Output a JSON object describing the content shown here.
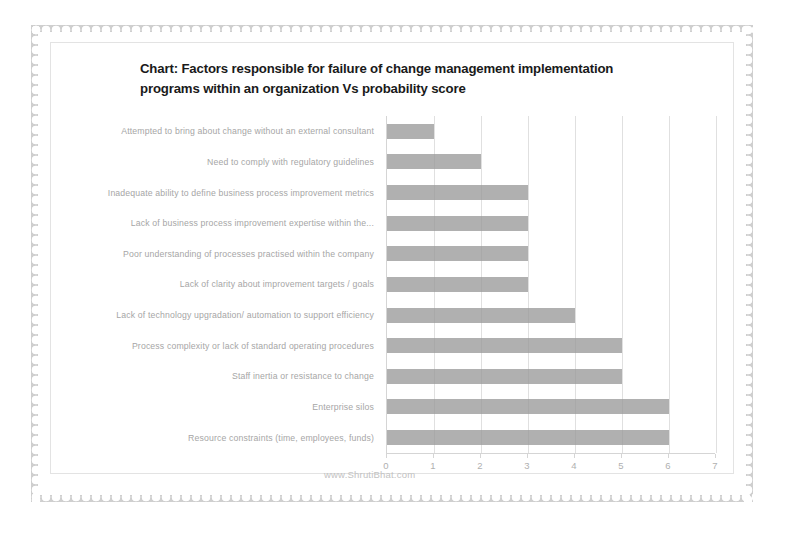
{
  "chart_data": {
    "type": "bar",
    "orientation": "horizontal",
    "title": "Chart: Factors responsible for failure of change management implementation programs within an organization Vs probability score",
    "title_line_1": "Chart: Factors responsible for failure of change management implementation",
    "title_line_2": "programs within an organization Vs probability score",
    "xlabel": "",
    "ylabel": "",
    "xlim": [
      0,
      7
    ],
    "grid": true,
    "legend": "none",
    "xticks": [
      "0",
      "1",
      "2",
      "3",
      "4",
      "5",
      "6",
      "7"
    ],
    "categories": [
      "Attempted to bring about change without an external consultant",
      "Need to comply with regulatory guidelines",
      "Inadequate ability to define business process improvement  metrics",
      "Lack of business process improvement expertise within the...",
      "Poor understanding of processes practised within the company",
      "Lack of clarity about improvement targets / goals",
      "Lack of technology upgradation/ automation to support efficiency",
      "Process complexity or lack of standard operating procedures",
      "Staff inertia or resistance to change",
      "Enterprise silos",
      "Resource constraints (time, employees, funds)"
    ],
    "values": [
      1,
      2,
      3,
      3,
      3,
      3,
      4,
      5,
      5,
      6,
      6
    ],
    "bar_color": "#9a9a9a",
    "grid_color": "#e0e0e0",
    "axis_color": "#d5d5d5",
    "label_color": "#a6a6a6"
  },
  "watermark": {
    "text": "www.ShrutiBhat.com"
  },
  "frame": {
    "border_color": "#cfcfcf",
    "background": "#ffffff"
  }
}
